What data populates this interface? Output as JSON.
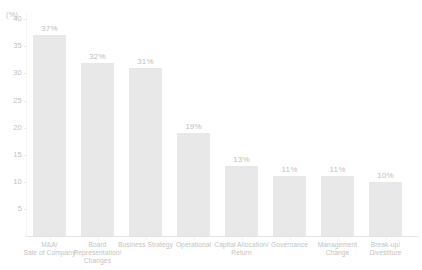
{
  "chart_data": {
    "type": "bar",
    "title": "",
    "xlabel": "",
    "ylabel": "(%)",
    "ylim": [
      0,
      40
    ],
    "grid": false,
    "legend": "none",
    "y_ticks": [
      "40",
      "35",
      "30",
      "25",
      "20",
      "15",
      "10",
      "5"
    ],
    "y_tick_values": [
      40,
      35,
      30,
      25,
      20,
      15,
      10,
      5
    ],
    "categories": [
      "M&A/\nSale of Company",
      "Board\nRepresentation/\nChanges",
      "Business Strategy",
      "Operational",
      "Capital Allocation/\nReturn",
      "Governance",
      "Management\nChange",
      "Break-up/\nDivestiture"
    ],
    "values": [
      37,
      32,
      31,
      19,
      13,
      11,
      11,
      10
    ],
    "value_labels": [
      "37%",
      "32%",
      "31%",
      "19%",
      "13%",
      "11%",
      "11%",
      "10%"
    ],
    "bar_color": "#e8e8e8",
    "text_color": "#c0c0c0",
    "axis_color": "#e4e4e4"
  }
}
